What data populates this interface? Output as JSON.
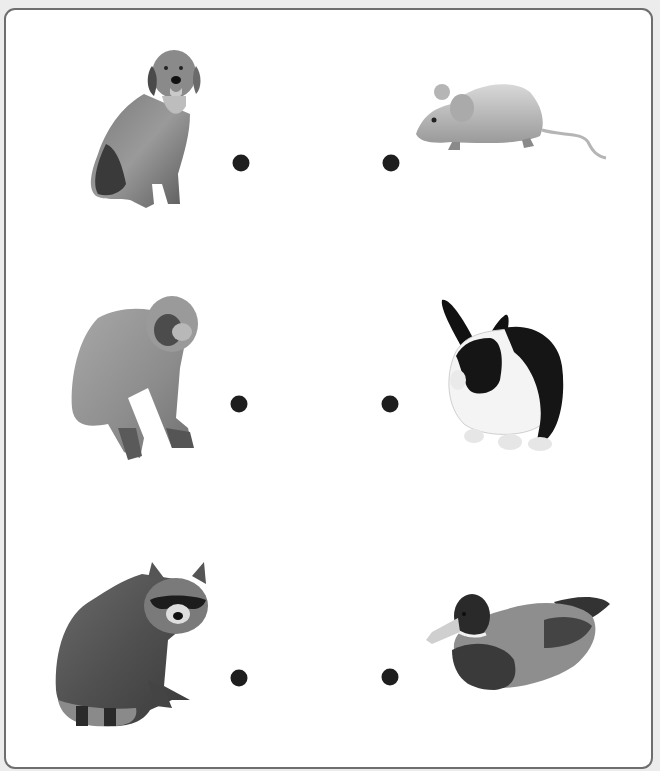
{
  "worksheet": {
    "type": "match-the-animals",
    "left_column": [
      {
        "id": "dog",
        "label": "dog",
        "icon": "dog-icon"
      },
      {
        "id": "monkey",
        "label": "monkey",
        "icon": "monkey-icon"
      },
      {
        "id": "raccoon",
        "label": "raccoon",
        "icon": "raccoon-icon"
      }
    ],
    "right_column": [
      {
        "id": "mouse",
        "label": "mouse",
        "icon": "mouse-icon"
      },
      {
        "id": "rabbit",
        "label": "rabbit",
        "icon": "rabbit-icon"
      },
      {
        "id": "duck",
        "label": "duck",
        "icon": "duck-icon"
      }
    ],
    "colors": {
      "border": "#6e6e6e",
      "dot": "#1e1e1e",
      "background": "#ffffff",
      "outside": "#ececec"
    }
  }
}
